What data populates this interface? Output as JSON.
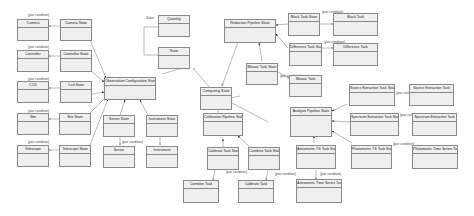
{
  "diagram": {
    "type": "uml-class-diagram",
    "classes": {
      "camera": "Camera",
      "camera_state": "Camera State",
      "controller": "Controller",
      "controller_state": "Controller State",
      "ccd": "CCD",
      "ccd_state": "Ccd State",
      "site": "Site",
      "site_state": "Site State",
      "telescope": "Telescope",
      "telescope_state": "Telescope State",
      "obs_config_state": "Observation Configuration State",
      "server_state": "Server State",
      "server": "Server",
      "instrument_state": "Instrument State",
      "instrument": "Instrument",
      "quantity": "Quantity",
      "state": "State",
      "computing_state": "Computing State",
      "reduction_pipeline_state": "Reduction Pipeline State",
      "mosaic_task_state": "Mosaic Task State",
      "mosaic_task": "Mosaic Task",
      "black_task_state": "Black Task State",
      "black_task": "Black Task",
      "difference_task_state": "Difference Task State",
      "difference_task": "Difference Task",
      "calibration_pipeline_state": "Calibration Pipeline State",
      "calibrate_task_state": "Calibrate Task State",
      "combine_task_state": "Combine Task State",
      "combine_task": "Combine Task",
      "calibrate_task": "Calibrate Task",
      "analysis_pipeline_state": "Analysis Pipeline State",
      "source_extraction_task_state": "Source Extraction Task State",
      "source_extraction_task": "Source Extraction Task",
      "spectrum_extraction_task_state": "Spectrum Extraction Task State",
      "spectrum_extraction_task": "Spectrum Extraction Task",
      "astrometric_ts_task_state": "Astrometric TS Task State",
      "astrometric_ts_task": "Astrometric Time Series Task",
      "photometric_ts_task_state": "Photometric TS Task State",
      "photometric_ts_task": "Photometric Time Series Task"
    },
    "edge_label": "{pair condition}",
    "self_label": "Value"
  }
}
